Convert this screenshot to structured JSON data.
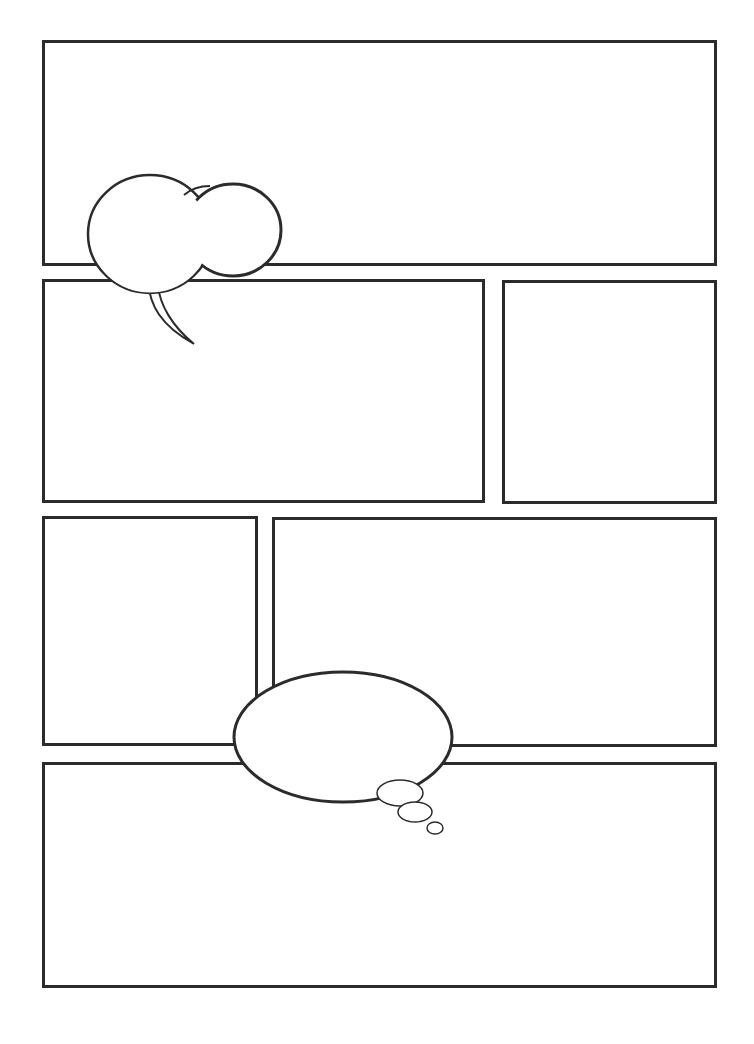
{
  "page": {
    "type": "comic-page-template",
    "background": "#ffffff",
    "stroke_color": "#2b2b2b"
  },
  "panels": [
    {
      "id": "panel-1",
      "x": 42,
      "y": 40,
      "w": 675,
      "h": 226
    },
    {
      "id": "panel-2",
      "x": 42,
      "y": 279,
      "w": 443,
      "h": 224
    },
    {
      "id": "panel-3",
      "x": 502,
      "y": 280,
      "w": 215,
      "h": 224
    },
    {
      "id": "panel-4",
      "x": 42,
      "y": 516,
      "w": 216,
      "h": 230
    },
    {
      "id": "panel-5",
      "x": 272,
      "y": 517,
      "w": 445,
      "h": 230
    },
    {
      "id": "panel-6",
      "x": 42,
      "y": 762,
      "w": 675,
      "h": 226
    }
  ],
  "bubbles": [
    {
      "id": "speech-bubble",
      "type": "speech",
      "text": ""
    },
    {
      "id": "thought-bubble",
      "type": "thought",
      "text": ""
    }
  ]
}
